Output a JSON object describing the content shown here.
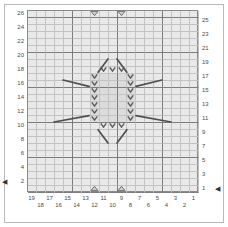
{
  "chart_title": "",
  "chart_data": {
    "type": "table",
    "title": "",
    "xlabel": "",
    "ylabel": "",
    "grid": {
      "columns": 19,
      "rows": 26,
      "major_every": 5,
      "grid": true
    },
    "xlim": [
      1,
      19
    ],
    "ylim": [
      1,
      26
    ],
    "row_labels_left": [
      26,
      24,
      22,
      20,
      18,
      16,
      14,
      12,
      10,
      8,
      6,
      4,
      2
    ],
    "row_labels_right": [
      25,
      23,
      21,
      19,
      17,
      15,
      13,
      11,
      9,
      7,
      5,
      3,
      1
    ],
    "column_labels": [
      19,
      18,
      17,
      16,
      15,
      14,
      13,
      12,
      11,
      10,
      9,
      8,
      7,
      6,
      5,
      4,
      3,
      2,
      1
    ],
    "start_markers": [
      {
        "side": "left",
        "row": 2,
        "glyph": "◀"
      },
      {
        "side": "right",
        "row": 1,
        "glyph": "◀"
      }
    ],
    "symbols": {
      "chevron": {
        "name": "chevron-down-stitch",
        "glyph": "V"
      },
      "triangle_down": {
        "name": "triangle-down-stitch",
        "glyph": "▽"
      },
      "triangle_up": {
        "name": "triangle-up-stitch",
        "glyph": "△"
      },
      "diagonal": {
        "name": "diagonal-line-stitch",
        "glyph": "╱"
      }
    },
    "triangles_down": [
      {
        "col": 12,
        "row": 26
      },
      {
        "col": 9,
        "row": 26
      }
    ],
    "triangles_up": [
      {
        "col": 12,
        "row": 1
      },
      {
        "col": 9,
        "row": 1
      }
    ],
    "chevrons": [
      {
        "col": 11,
        "row": 18
      },
      {
        "col": 10,
        "row": 18
      },
      {
        "col": 9,
        "row": 18
      },
      {
        "col": 12,
        "row": 17
      },
      {
        "col": 8,
        "row": 17
      },
      {
        "col": 12,
        "row": 16
      },
      {
        "col": 8,
        "row": 16
      },
      {
        "col": 12,
        "row": 15
      },
      {
        "col": 8,
        "row": 15
      },
      {
        "col": 12,
        "row": 14
      },
      {
        "col": 8,
        "row": 14
      },
      {
        "col": 12,
        "row": 13
      },
      {
        "col": 8,
        "row": 13
      },
      {
        "col": 12,
        "row": 12
      },
      {
        "col": 8,
        "row": 12
      },
      {
        "col": 12,
        "row": 11
      },
      {
        "col": 8,
        "row": 11
      },
      {
        "col": 11,
        "row": 10
      },
      {
        "col": 10,
        "row": 10
      },
      {
        "col": 9,
        "row": 10
      }
    ],
    "diagonals": [
      {
        "x1": 10.5,
        "y1": 19.5,
        "x2": 11.6,
        "y2": 17.6
      },
      {
        "x1": 9.5,
        "y1": 19.5,
        "x2": 8.4,
        "y2": 17.6
      },
      {
        "x1": 15.5,
        "y1": 16.5,
        "x2": 12.6,
        "y2": 15.6
      },
      {
        "x1": 4.5,
        "y1": 16.5,
        "x2": 7.4,
        "y2": 15.6
      },
      {
        "x1": 16.5,
        "y1": 10.5,
        "x2": 12.6,
        "y2": 11.4
      },
      {
        "x1": 3.5,
        "y1": 10.5,
        "x2": 7.4,
        "y2": 11.4
      },
      {
        "x1": 10.5,
        "y1": 7.5,
        "x2": 11.6,
        "y2": 9.4
      },
      {
        "x1": 9.5,
        "y1": 7.5,
        "x2": 8.4,
        "y2": 9.4
      }
    ],
    "shaded_block": {
      "col_start": 8,
      "col_end": 12,
      "row_start": 11,
      "row_end": 17
    },
    "legend": []
  },
  "axes": {
    "left_label_title": "",
    "right_label_title": "",
    "bottom_label_title": ""
  }
}
